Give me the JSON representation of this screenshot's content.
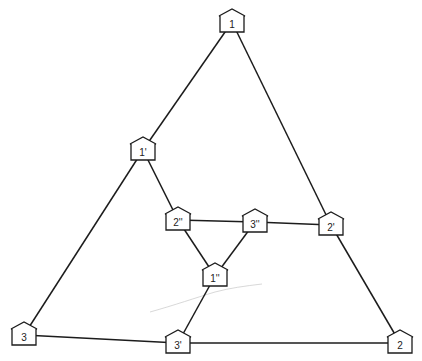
{
  "diagram": {
    "colors": {
      "line": "#1c1c1c",
      "background": "#ffffff"
    },
    "nodes": [
      {
        "id": "n1",
        "label": "1",
        "x": 232,
        "y": 22
      },
      {
        "id": "n1p",
        "label": "1'",
        "x": 143,
        "y": 150
      },
      {
        "id": "n2pp",
        "label": "2''",
        "x": 178,
        "y": 220
      },
      {
        "id": "n3pp",
        "label": "3''",
        "x": 255,
        "y": 222
      },
      {
        "id": "n2p",
        "label": "2'",
        "x": 331,
        "y": 225
      },
      {
        "id": "n1pp",
        "label": "1''",
        "x": 215,
        "y": 276
      },
      {
        "id": "n3",
        "label": "3",
        "x": 24,
        "y": 335
      },
      {
        "id": "n3p",
        "label": "3'",
        "x": 178,
        "y": 343
      },
      {
        "id": "n2",
        "label": "2",
        "x": 400,
        "y": 343
      }
    ],
    "edges": [
      [
        "n1",
        "n1p"
      ],
      [
        "n1p",
        "n3"
      ],
      [
        "n1",
        "n2p"
      ],
      [
        "n2p",
        "n2"
      ],
      [
        "n3",
        "n3p"
      ],
      [
        "n3p",
        "n2"
      ],
      [
        "n1p",
        "n2pp"
      ],
      [
        "n2pp",
        "n3pp"
      ],
      [
        "n3pp",
        "n2p"
      ],
      [
        "n2pp",
        "n1pp"
      ],
      [
        "n3pp",
        "n1pp"
      ],
      [
        "n1pp",
        "n3p"
      ]
    ]
  }
}
